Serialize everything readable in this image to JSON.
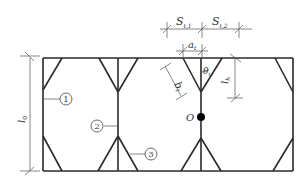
{
  "diagram": {
    "type": "structural-truss-schematic",
    "colors": {
      "frame": "#2a2a2a",
      "dim": "#555555",
      "node": "#000000"
    },
    "dimensions": {
      "s1": {
        "main": "S",
        "sub": "t,1"
      },
      "s2": {
        "main": "S",
        "sub": "t,2"
      },
      "a": {
        "main": "a",
        "sub": "t"
      },
      "b": {
        "main": "b",
        "sub": "t"
      },
      "lh": {
        "main": "l",
        "sub": "h"
      },
      "l0": {
        "main": "l",
        "sub": "0"
      },
      "theta": {
        "main": "θ",
        "sub": "t"
      }
    },
    "point_label": "O",
    "callouts": [
      {
        "id": "1",
        "text": "1"
      },
      {
        "id": "2",
        "text": "2"
      },
      {
        "id": "3",
        "text": "3"
      }
    ]
  }
}
